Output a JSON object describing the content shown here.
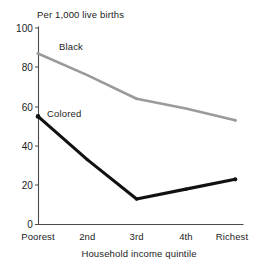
{
  "chart_data": {
    "type": "line",
    "title": "Per 1,000 live births",
    "xlabel": "Household income quintile",
    "ylabel": "",
    "categories": [
      "Poorest",
      "2nd",
      "3rd",
      "4th",
      "Richest"
    ],
    "ylim": [
      0,
      100
    ],
    "yticks": [
      "0",
      "20",
      "40",
      "60",
      "80",
      "100"
    ],
    "ytick_values": [
      0,
      20,
      40,
      60,
      80,
      100
    ],
    "grid": false,
    "legend_position": "inline-annotation",
    "series": [
      {
        "name": "Black",
        "color": "#9a9a9a",
        "values": [
          87,
          76,
          64,
          59,
          53
        ],
        "label_text": "Black"
      },
      {
        "name": "Colored",
        "color": "#111111",
        "values": [
          55,
          33,
          13,
          18,
          23
        ],
        "label_text": "Colored"
      }
    ]
  },
  "axis": {
    "y_tick_0": "0",
    "y_tick_20": "20",
    "y_tick_40": "40",
    "y_tick_60": "60",
    "y_tick_80": "80",
    "y_tick_100": "100",
    "x_tick_0": "Poorest",
    "x_tick_1": "2nd",
    "x_tick_2": "3rd",
    "x_tick_3": "4th",
    "x_tick_4": "Richest"
  },
  "annotations": {
    "series_label_black": "Black",
    "series_label_colored": "Colored"
  },
  "colors": {
    "series_black": "#9a9a9a",
    "series_colored": "#111111",
    "axis": "#4a4a4a",
    "text": "#1c1c1c",
    "background": "#ffffff"
  }
}
